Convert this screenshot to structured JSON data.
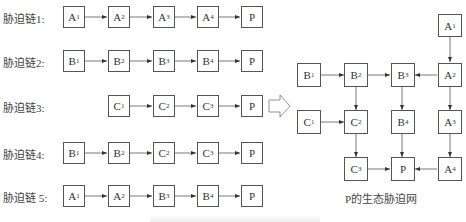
{
  "chains": [
    {
      "label": "胁迫链1:",
      "nodes": [
        {
          "b": "A",
          "s": "1"
        },
        {
          "b": "A",
          "s": "2"
        },
        {
          "b": "A",
          "s": "3"
        },
        {
          "b": "A",
          "s": "4"
        },
        {
          "b": "P",
          "s": ""
        }
      ]
    },
    {
      "label": "胁迫链2:",
      "nodes": [
        {
          "b": "B",
          "s": "1"
        },
        {
          "b": "B",
          "s": "2"
        },
        {
          "b": "B",
          "s": "3"
        },
        {
          "b": "B",
          "s": "4"
        },
        {
          "b": "P",
          "s": ""
        }
      ]
    },
    {
      "label": "胁迫链3:",
      "nodes": [
        {
          "b": "C",
          "s": "1"
        },
        {
          "b": "C",
          "s": "2"
        },
        {
          "b": "C",
          "s": "3"
        },
        {
          "b": "P",
          "s": ""
        }
      ]
    },
    {
      "label": "胁迫链4:",
      "nodes": [
        {
          "b": "B",
          "s": "1"
        },
        {
          "b": "B",
          "s": "2"
        },
        {
          "b": "C",
          "s": "2"
        },
        {
          "b": "C",
          "s": "3"
        },
        {
          "b": "P",
          "s": ""
        }
      ]
    },
    {
      "label": "胁迫链 5:",
      "nodes": [
        {
          "b": "A",
          "s": "1"
        },
        {
          "b": "A",
          "s": "2"
        },
        {
          "b": "B",
          "s": "3"
        },
        {
          "b": "B",
          "s": "4"
        },
        {
          "b": "P",
          "s": ""
        }
      ]
    }
  ],
  "network": {
    "title": "P的生态胁迫网",
    "nodes": {
      "A1": {
        "b": "A",
        "s": "1"
      },
      "B1": {
        "b": "B",
        "s": "1"
      },
      "B2": {
        "b": "B",
        "s": "2"
      },
      "B3": {
        "b": "B",
        "s": "3"
      },
      "A2": {
        "b": "A",
        "s": "2"
      },
      "C1": {
        "b": "C",
        "s": "1"
      },
      "C2": {
        "b": "C",
        "s": "2"
      },
      "B4": {
        "b": "B",
        "s": "4"
      },
      "A3": {
        "b": "A",
        "s": "3"
      },
      "C3": {
        "b": "C",
        "s": "3"
      },
      "P": {
        "b": "P",
        "s": ""
      },
      "A4": {
        "b": "A",
        "s": "4"
      }
    }
  }
}
